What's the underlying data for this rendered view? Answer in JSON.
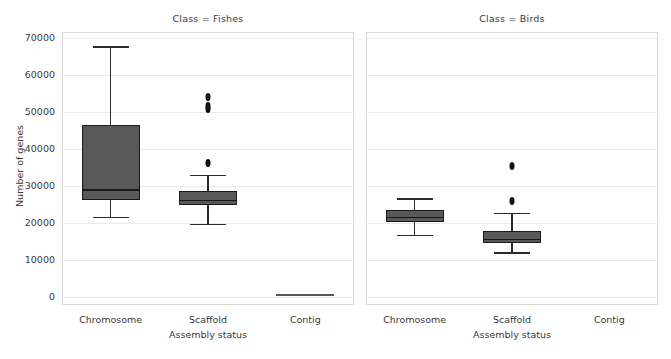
{
  "figure": {
    "background_color": "#ffffff",
    "axis_color": "#3a3a3a",
    "grid_color": "#eaeaea",
    "box_fill_color": "#595959",
    "box_edge_color": "#1a1a1a"
  },
  "axes": {
    "ylabel": "Number of genes",
    "xlabel": "Assembly status",
    "ytick_labels": [
      "70000",
      "60000",
      "50000",
      "40000",
      "30000",
      "20000",
      "10000",
      "0"
    ],
    "ytick_values": [
      70000,
      60000,
      50000,
      40000,
      30000,
      20000,
      10000,
      0
    ],
    "xtick_labels": [
      "Chromosome",
      "Scaffold",
      "Contig"
    ]
  },
  "panels": [
    {
      "title": "Class = Fishes"
    },
    {
      "title": "Class = Birds"
    }
  ],
  "chart_data": {
    "type": "box",
    "title": "",
    "xlabel": "Assembly status",
    "ylabel": "Number of genes",
    "ylim": [
      -3500,
      73000
    ],
    "yticks": [
      0,
      10000,
      20000,
      30000,
      40000,
      50000,
      60000,
      70000
    ],
    "grid": true,
    "legend": null,
    "facet_by": "Class",
    "categories": [
      "Chromosome",
      "Scaffold",
      "Contig"
    ],
    "panels": [
      {
        "title": "Class = Fishes",
        "facet_value": "Fishes",
        "boxes": [
          {
            "category": "Chromosome",
            "whisker_low": 21300,
            "q1": 25900,
            "median": 28700,
            "q3": 46100,
            "whisker_high": 67500,
            "outliers": []
          },
          {
            "category": "Scaffold",
            "whisker_low": 19500,
            "q1": 24700,
            "median": 25800,
            "q3": 28400,
            "whisker_high": 32700,
            "outliers": [
              36000,
              50600,
              51300,
              53800
            ]
          },
          {
            "category": "Contig",
            "whisker_low": 300,
            "q1": 300,
            "median": 300,
            "q3": 300,
            "whisker_high": 300,
            "outliers": [],
            "degenerate": true
          }
        ]
      },
      {
        "title": "Class = Birds",
        "facet_value": "Birds",
        "boxes": [
          {
            "category": "Chromosome",
            "whisker_low": 16500,
            "q1": 19900,
            "median": 21200,
            "q3": 23200,
            "whisker_high": 26400,
            "outliers": []
          },
          {
            "category": "Scaffold",
            "whisker_low": 11800,
            "q1": 14300,
            "median": 15300,
            "q3": 17500,
            "whisker_high": 22400,
            "outliers": [
              25800,
              35200
            ]
          },
          {
            "category": "Contig",
            "whisker_low": null,
            "q1": null,
            "median": null,
            "q3": null,
            "whisker_high": null,
            "outliers": [],
            "empty": true
          }
        ]
      }
    ]
  },
  "geometry": {
    "panels": [
      {
        "left": 62,
        "right": 354,
        "top": 32,
        "bottom": 305
      },
      {
        "left": 366,
        "right": 658,
        "top": 32,
        "bottom": 305
      }
    ],
    "y_zero_px": 296,
    "y_per_unit_px": 0.0037,
    "category_fractions": [
      0.1667,
      0.5,
      0.8333
    ],
    "box_width_px": 58
  }
}
